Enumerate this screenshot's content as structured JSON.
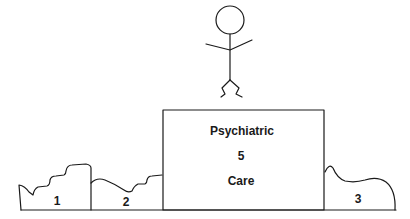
{
  "diagram": {
    "type": "podium-blocks",
    "figure": "stick-figure",
    "blocks": [
      {
        "id": "block-1",
        "label": "1"
      },
      {
        "id": "block-2",
        "label": "2"
      },
      {
        "id": "block-5",
        "label": "5",
        "title_top": "Psychiatric",
        "title_bottom": "Care"
      },
      {
        "id": "block-3",
        "label": "3"
      }
    ],
    "colors": {
      "line": "#1a1a1a",
      "background": "#ffffff"
    }
  }
}
